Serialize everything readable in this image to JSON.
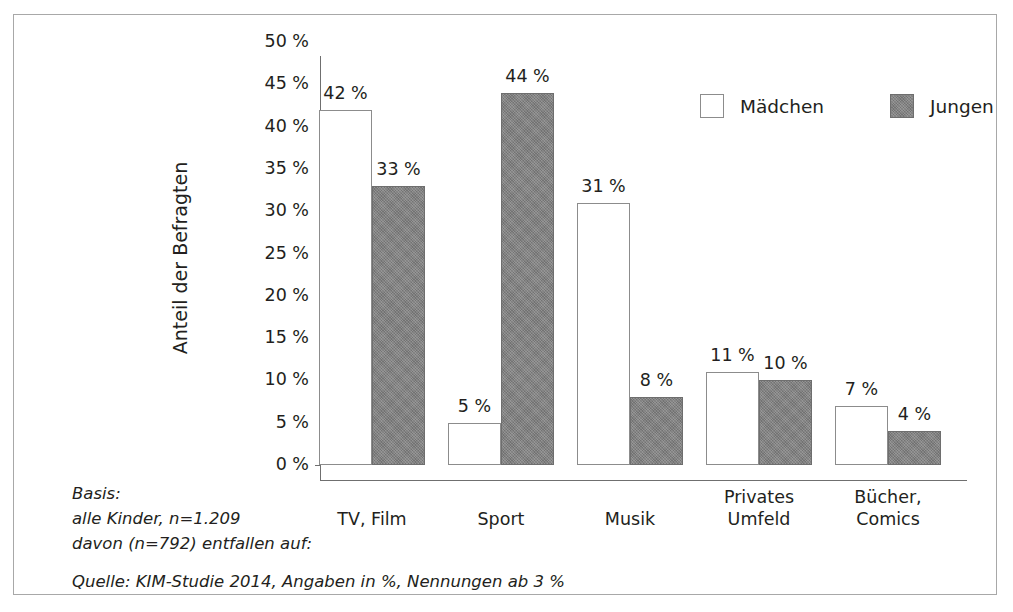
{
  "chart_data": {
    "type": "bar",
    "title": "",
    "xlabel": "",
    "ylabel": "Anteil der Befragten",
    "ylim": [
      0,
      50
    ],
    "grid": false,
    "legend_position": "top-right",
    "categories": [
      "TV, Film",
      "Sport",
      "Musik",
      "Privates\nUmfeld",
      "Bücher,\nComics"
    ],
    "series": [
      {
        "name": "Mädchen",
        "color": "#ffffff",
        "values": [
          42,
          5,
          31,
          11,
          7
        ]
      },
      {
        "name": "Jungen",
        "color": "#808080",
        "values": [
          33,
          44,
          8,
          10,
          4
        ]
      }
    ],
    "value_labels": {
      "maedchen": [
        "42 %",
        "5 %",
        "31 %",
        "11 %",
        "7 %"
      ],
      "jungen": [
        "33 %",
        "44 %",
        "8 %",
        "10 %",
        "4 %"
      ]
    },
    "y_ticks": [
      "0 %",
      "5 %",
      "10 %",
      "15 %",
      "20 %",
      "25 %",
      "30 %",
      "35 %",
      "40 %",
      "45 %",
      "50 %"
    ],
    "annotations": [
      "Basis:",
      "alle Kinder, n=1.209",
      "davon (n=792) entfallen auf:",
      "Quelle: KIM-Studie 2014, Angaben in %, Nennungen ab 3 %"
    ]
  },
  "legend": {
    "items": [
      {
        "label": "Mädchen"
      },
      {
        "label": "Jungen"
      }
    ]
  },
  "footnotes": {
    "basis_line1": "Basis:",
    "basis_line2": "alle Kinder, n=1.209",
    "basis_line3": "davon (n=792) entfallen auf:",
    "source": "Quelle: KIM-Studie 2014, Angaben in %, Nennungen ab 3 %"
  }
}
